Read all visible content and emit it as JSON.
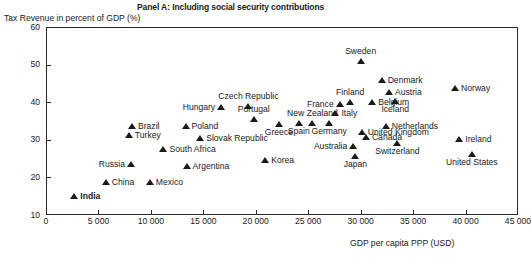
{
  "chart_data": {
    "type": "scatter",
    "title": "Panel A: Including social security contributions",
    "xlabel": "GDP per capita PPP (USD)",
    "ylabel": "Tax Revenue in percent of GDP (%)",
    "xlim": [
      0,
      45000
    ],
    "ylim": [
      10,
      60
    ],
    "xticks": [
      0,
      5000,
      10000,
      15000,
      20000,
      25000,
      30000,
      35000,
      40000,
      45000
    ],
    "xtick_labels": [
      "0",
      "5 000",
      "10 000",
      "15 000",
      "20 000",
      "25 000",
      "30 000",
      "35 000",
      "40 000",
      "45 000"
    ],
    "yticks": [
      10,
      20,
      30,
      40,
      50,
      60
    ],
    "ytick_labels": [
      "10",
      "20",
      "30",
      "40",
      "50",
      "60"
    ],
    "grid": false,
    "legend": false,
    "marker": "triangle-up",
    "marker_color": "#1a1a1a",
    "points": [
      {
        "name": "India",
        "x": 2700,
        "y": 15.0,
        "label_pos": "right",
        "bold": true
      },
      {
        "name": "China",
        "x": 5700,
        "y": 18.8,
        "label_pos": "right",
        "bold": false
      },
      {
        "name": "Russia",
        "x": 8100,
        "y": 23.5,
        "label_pos": "left",
        "bold": false
      },
      {
        "name": "Turkey",
        "x": 7900,
        "y": 31.3,
        "label_pos": "right",
        "bold": false
      },
      {
        "name": "Brazil",
        "x": 8200,
        "y": 33.8,
        "label_pos": "right",
        "bold": false
      },
      {
        "name": "Mexico",
        "x": 9900,
        "y": 18.9,
        "label_pos": "right",
        "bold": false
      },
      {
        "name": "South Africa",
        "x": 11200,
        "y": 27.5,
        "label_pos": "right",
        "bold": false
      },
      {
        "name": "Poland",
        "x": 13300,
        "y": 33.8,
        "label_pos": "right",
        "bold": false
      },
      {
        "name": "Argentina",
        "x": 13400,
        "y": 23.1,
        "label_pos": "right",
        "bold": false
      },
      {
        "name": "Slovak Republic",
        "x": 14700,
        "y": 30.6,
        "label_pos": "right",
        "bold": false
      },
      {
        "name": "Hungary",
        "x": 16700,
        "y": 38.8,
        "label_pos": "left",
        "bold": false
      },
      {
        "name": "Czech Republic",
        "x": 19300,
        "y": 38.9,
        "label_pos": "above",
        "bold": false
      },
      {
        "name": "Portugal",
        "x": 19800,
        "y": 35.4,
        "label_pos": "above",
        "bold": false
      },
      {
        "name": "Korea",
        "x": 20900,
        "y": 24.6,
        "label_pos": "right",
        "bold": false
      },
      {
        "name": "Greece",
        "x": 22200,
        "y": 34.2,
        "label_pos": "below",
        "bold": false
      },
      {
        "name": "New Zealand",
        "x": 25400,
        "y": 34.4,
        "label_pos": "above",
        "bold": false
      },
      {
        "name": "Spain",
        "x": 24100,
        "y": 34.5,
        "label_pos": "below",
        "bold": false
      },
      {
        "name": "Germany",
        "x": 27000,
        "y": 34.5,
        "label_pos": "below",
        "bold": false
      },
      {
        "name": "Italy",
        "x": 27600,
        "y": 37.1,
        "label_pos": "right",
        "bold": false
      },
      {
        "name": "France",
        "x": 28000,
        "y": 39.4,
        "label_pos": "left",
        "bold": false
      },
      {
        "name": "Finland",
        "x": 29000,
        "y": 40.0,
        "label_pos": "above",
        "bold": false
      },
      {
        "name": "Sweden",
        "x": 30000,
        "y": 51.0,
        "label_pos": "above",
        "bold": false
      },
      {
        "name": "Japan",
        "x": 29500,
        "y": 25.6,
        "label_pos": "below",
        "bold": false
      },
      {
        "name": "Australia",
        "x": 29300,
        "y": 28.3,
        "label_pos": "left",
        "bold": false
      },
      {
        "name": "United Kingdom",
        "x": 30100,
        "y": 32.2,
        "label_pos": "right",
        "bold": false
      },
      {
        "name": "Belgium",
        "x": 31100,
        "y": 40.1,
        "label_pos": "right",
        "bold": false
      },
      {
        "name": "Denmark",
        "x": 32000,
        "y": 46.0,
        "label_pos": "right",
        "bold": false
      },
      {
        "name": "Canada",
        "x": 30500,
        "y": 30.8,
        "label_pos": "right",
        "bold": false
      },
      {
        "name": "Netherlands",
        "x": 32400,
        "y": 33.6,
        "label_pos": "right",
        "bold": false
      },
      {
        "name": "Austria",
        "x": 32700,
        "y": 42.7,
        "label_pos": "right",
        "bold": false
      },
      {
        "name": "Iceland",
        "x": 33300,
        "y": 40.2,
        "label_pos": "below",
        "bold": false
      },
      {
        "name": "Switzerland",
        "x": 33500,
        "y": 29.1,
        "label_pos": "below",
        "bold": false
      },
      {
        "name": "Norway",
        "x": 39000,
        "y": 43.9,
        "label_pos": "right",
        "bold": false
      },
      {
        "name": "Ireland",
        "x": 39400,
        "y": 30.2,
        "label_pos": "right",
        "bold": false
      },
      {
        "name": "United States",
        "x": 40600,
        "y": 26.1,
        "label_pos": "below",
        "bold": false
      }
    ]
  }
}
